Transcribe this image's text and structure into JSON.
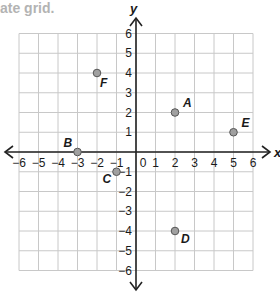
{
  "header": {
    "title_fragment": "ate grid."
  },
  "colors": {
    "grid": "#c8c8c8",
    "axis": "#222222",
    "point_fill": "#a0a0a0",
    "point_stroke": "#555555",
    "title": "#b3b3b3"
  },
  "chart_data": {
    "type": "scatter",
    "title": "ate grid.",
    "xlabel": "x",
    "ylabel": "y",
    "xlim": [
      -6,
      6
    ],
    "ylim": [
      -6,
      6
    ],
    "grid": true,
    "x_ticks": [
      -6,
      -5,
      -4,
      -3,
      -2,
      -1,
      0,
      1,
      2,
      3,
      4,
      5,
      6
    ],
    "y_ticks": [
      -6,
      -5,
      -4,
      -3,
      -2,
      -1,
      1,
      2,
      3,
      4,
      5,
      6
    ],
    "points": [
      {
        "label": "A",
        "x": 2,
        "y": 2
      },
      {
        "label": "B",
        "x": -3,
        "y": 0
      },
      {
        "label": "C",
        "x": -1,
        "y": -1
      },
      {
        "label": "D",
        "x": 2,
        "y": -4
      },
      {
        "label": "E",
        "x": 5,
        "y": 1
      },
      {
        "label": "F",
        "x": -2,
        "y": 4
      }
    ]
  }
}
